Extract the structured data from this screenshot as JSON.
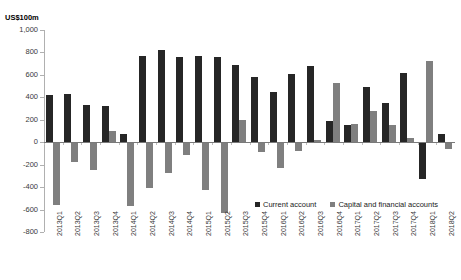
{
  "chart_data": {
    "type": "bar",
    "title": "",
    "subtitle": "",
    "unit_label": "US$100m",
    "xlabel": "",
    "ylabel": "",
    "ylim": [
      -800,
      1000
    ],
    "ytick_step": 200,
    "ytick_labels": [
      "1,000",
      "800",
      "600",
      "400",
      "200",
      "0",
      "-200",
      "-400",
      "-600",
      "-800"
    ],
    "ytick_values": [
      1000,
      800,
      600,
      400,
      200,
      0,
      -200,
      -400,
      -600,
      -800
    ],
    "grid": false,
    "legend_position": "bottom-right",
    "categories": [
      "2013Q1",
      "2013Q2",
      "2013Q3",
      "2013Q4",
      "2014Q1",
      "2014Q2",
      "2014Q3",
      "2014Q4",
      "2015Q1",
      "2015Q2",
      "2015Q3",
      "2015Q4",
      "2016Q1",
      "2016Q2",
      "2016Q3",
      "2016Q4",
      "2017Q1",
      "2017Q2",
      "2017Q3",
      "2017Q4",
      "2018Q1",
      "2018Q2"
    ],
    "series": [
      {
        "name": "Current account",
        "color": "#262626",
        "values": [
          420,
          430,
          330,
          320,
          70,
          770,
          820,
          760,
          770,
          760,
          690,
          580,
          450,
          610,
          680,
          190,
          155,
          490,
          350,
          620,
          -330,
          70
        ]
      },
      {
        "name": "Capital and financial accounts",
        "color": "#7f7f7f",
        "values": [
          -560,
          -175,
          -250,
          100,
          -570,
          -410,
          -270,
          -110,
          -430,
          -630,
          195,
          -90,
          -230,
          -80,
          20,
          525,
          165,
          280,
          155,
          35,
          720,
          -60
        ]
      }
    ]
  },
  "legend": {
    "items": [
      {
        "label": "Current account",
        "color": "#262626"
      },
      {
        "label": "Capital and financial accounts",
        "color": "#7f7f7f"
      }
    ]
  }
}
